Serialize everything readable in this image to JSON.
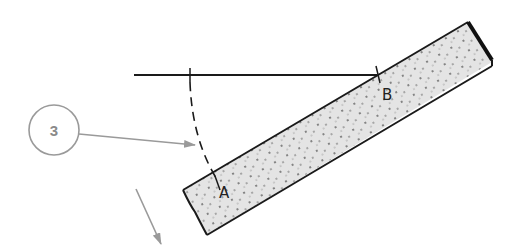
{
  "diagram": {
    "callout": {
      "number": "3"
    },
    "labels": {
      "point_a": "A",
      "point_b": "B"
    },
    "colors": {
      "line": "#1a1a1a",
      "callout": "#9a9a9a",
      "board_fill": "#e4e4e4",
      "board_stipple": "#555555",
      "background": "#ffffff"
    },
    "elements": {
      "reference_line": {
        "from": [
          134,
          75
        ],
        "to": [
          377,
          75
        ]
      },
      "tick_mark": {
        "x": 190,
        "y": 75
      },
      "dashed_arc": {
        "from": [
          190,
          75
        ],
        "to": [
          218,
          181
        ]
      },
      "board": {
        "corners": [
          [
            183,
            190
          ],
          [
            468,
            22
          ],
          [
            492,
            62
          ],
          [
            207,
            235
          ]
        ]
      },
      "callout_circle": {
        "center": [
          54,
          130
        ],
        "radius": 25
      },
      "callout_arrow": {
        "from": [
          79,
          134
        ],
        "to": [
          195,
          145
        ]
      },
      "direction_arrow": {
        "from": [
          136,
          189
        ],
        "to": [
          161,
          244
        ]
      }
    }
  }
}
